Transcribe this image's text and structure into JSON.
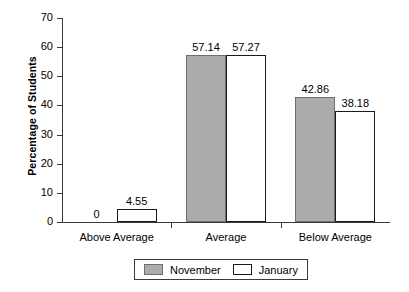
{
  "chart_data": {
    "type": "bar",
    "title": "",
    "subtitle": "",
    "xlabel": "",
    "ylabel": "Percentage of Students",
    "categories": [
      "Above Average",
      "Average",
      "Below Average"
    ],
    "series": [
      {
        "name": "November",
        "color": "#ababab",
        "values": [
          0,
          57.14,
          42.86
        ],
        "labels": [
          "0",
          "57.14",
          "42.86"
        ]
      },
      {
        "name": "January",
        "color": "#ffffff",
        "values": [
          4.55,
          57.27,
          38.18
        ],
        "labels": [
          "4.55",
          "57.27",
          "38.18"
        ]
      }
    ],
    "ylim": [
      0,
      70
    ],
    "yticks": [
      0,
      10,
      20,
      30,
      40,
      50,
      60,
      70
    ],
    "ytick_labels": [
      "0",
      "10",
      "20",
      "30",
      "40",
      "50",
      "60",
      "70"
    ],
    "grid": false,
    "legend_position": "bottom",
    "legend_entries": [
      "November",
      "January"
    ],
    "value_labels_shown": true,
    "bar_border_color": "#1a1a1a",
    "axis_color": "#3a3a3a"
  }
}
